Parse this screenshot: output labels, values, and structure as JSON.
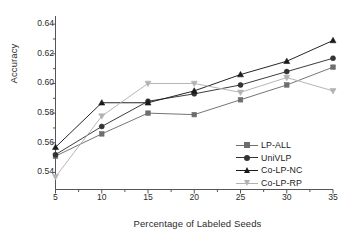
{
  "chart_data": {
    "type": "line",
    "title": "",
    "xlabel": "Percentage of Labeled Seeds",
    "ylabel": "Accuracy",
    "x": [
      5,
      10,
      15,
      20,
      25,
      30,
      35
    ],
    "xtick_labels": [
      "5",
      "10",
      "15",
      "20",
      "25",
      "30",
      "35"
    ],
    "ytick_labels": [
      "0.54",
      "0.56",
      "0.58",
      "0.60",
      "0.62",
      "0.64"
    ],
    "yticks": [
      0.54,
      0.56,
      0.58,
      0.6,
      0.62,
      0.64
    ],
    "xlim": [
      5,
      35
    ],
    "ylim": [
      0.5285,
      0.6455
    ],
    "grid": false,
    "legend_position": "lower-right-inside",
    "series": [
      {
        "name": "LP-ALL",
        "marker": "square",
        "color": "#6e6e6e",
        "values": [
          0.551,
          0.566,
          0.58,
          0.579,
          0.589,
          0.599,
          0.611
        ]
      },
      {
        "name": "UniVLP",
        "marker": "circle",
        "color": "#333333",
        "values": [
          0.552,
          0.571,
          0.588,
          0.593,
          0.599,
          0.608,
          0.617
        ]
      },
      {
        "name": "Co-LP-NC",
        "marker": "triangle-up",
        "color": "#1a1a1a",
        "values": [
          0.557,
          0.587,
          0.587,
          0.595,
          0.606,
          0.615,
          0.629
        ]
      },
      {
        "name": "Co-LP-RP",
        "marker": "triangle-down",
        "color": "#b2b2b2",
        "values": [
          0.537,
          0.578,
          0.6,
          0.6,
          0.594,
          0.604,
          0.595
        ]
      }
    ]
  },
  "axis": {
    "frame_color": "#555555"
  }
}
